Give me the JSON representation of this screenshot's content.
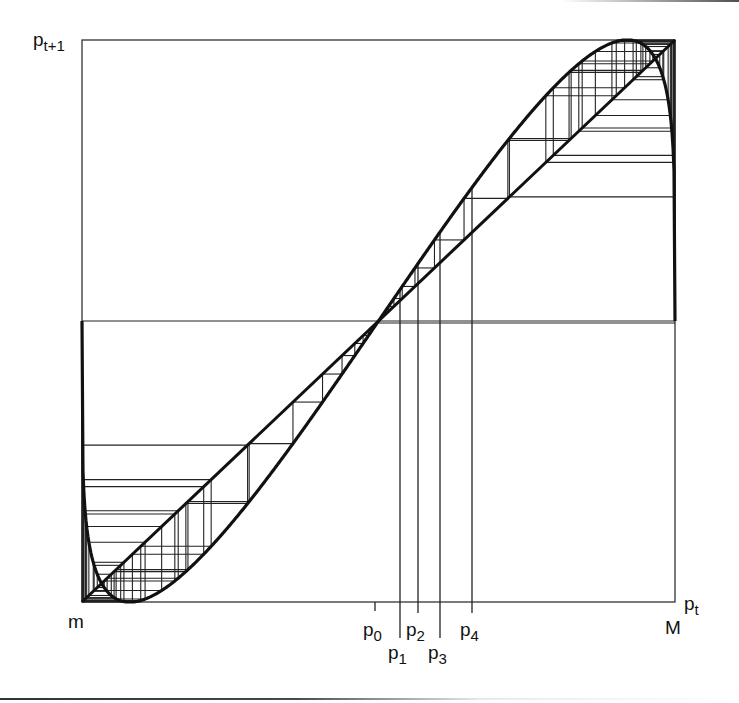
{
  "figure": {
    "type": "cobweb-diagram",
    "box": {
      "left": 82,
      "right": 675,
      "top": 40,
      "bottom": 602
    },
    "colors": {
      "ink": "#111111",
      "thin": "#222222",
      "frame": "#333333"
    }
  },
  "labels": {
    "y_axis": {
      "base": "p",
      "sub": "t+1"
    },
    "x_axis": {
      "base": "p",
      "sub": "t"
    },
    "x_min": "m",
    "x_max": "M",
    "iterates": [
      {
        "base": "p",
        "sub": "0",
        "x": 375,
        "tick_bottom": 611,
        "label_top": 620
      },
      {
        "base": "p",
        "sub": "1",
        "x": 400,
        "tick_bottom": 638,
        "label_top": 643
      },
      {
        "base": "p",
        "sub": "2",
        "x": 418,
        "tick_bottom": 613,
        "label_top": 620
      },
      {
        "base": "p",
        "sub": "3",
        "x": 440,
        "tick_bottom": 638,
        "label_top": 643
      },
      {
        "base": "p",
        "sub": "4",
        "x": 472,
        "tick_bottom": 613,
        "label_top": 620
      }
    ]
  },
  "chart_data": {
    "type": "line",
    "title": "",
    "xlabel": "p_t",
    "ylabel": "p_t+1",
    "xlim": [
      "m",
      "M"
    ],
    "ylim": [
      "m",
      "M"
    ],
    "grid": false,
    "series": [
      {
        "name": "map f(p_t)",
        "shape": "S-shaped cubic-like map, f(m)≈mid, minimum≈(0.08,0), fixed point (0.5,0.5), maximum≈(0.91,1), f(M)≈mid",
        "params": {
          "c": 1.54,
          "p": 0.21
        }
      },
      {
        "name": "diagonal p_t+1 = p_t",
        "x": [
          0,
          1
        ],
        "y": [
          0,
          1
        ]
      },
      {
        "name": "cobweb orbit",
        "start": 0.503,
        "iterations": 60
      }
    ],
    "annotations": [
      "m",
      "M",
      "p0",
      "p1",
      "p2",
      "p3",
      "p4"
    ],
    "iterate_x_normalized": [
      0.494,
      0.536,
      0.567,
      0.604,
      0.658
    ]
  }
}
